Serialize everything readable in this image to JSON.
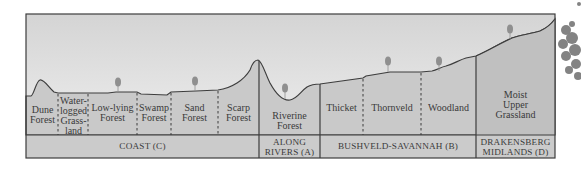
{
  "colors": {
    "sky_top": "#d6d6d6",
    "sky_bottom": "#ececec",
    "ground": "#c9c9c9",
    "band": "#cbcbcb",
    "line": "#3d3d3d",
    "tree": "#8f8f8f",
    "text": "#3a3a3a"
  },
  "vegetation_types": [
    {
      "label": "Dune\nForest",
      "x": 42,
      "y": 106
    },
    {
      "label": "Water-\nlogged\nGrass-\nland",
      "x": 73,
      "y": 96
    },
    {
      "label": "Low-lying\nForest",
      "x": 112,
      "y": 103
    },
    {
      "label": "Swamp\nForest",
      "x": 154,
      "y": 103
    },
    {
      "label": "Sand\nForest",
      "x": 194,
      "y": 103
    },
    {
      "label": "Scarp\nForest",
      "x": 238,
      "y": 103
    },
    {
      "label": "Riverine\nForest",
      "x": 290,
      "y": 111
    },
    {
      "label": "Thicket",
      "x": 341,
      "y": 103
    },
    {
      "label": "Thornveld",
      "x": 392,
      "y": 103
    },
    {
      "label": "Woodland",
      "x": 448,
      "y": 103
    },
    {
      "label": "Moist\nUpper\nGrassland",
      "x": 515,
      "y": 89
    }
  ],
  "regions": [
    {
      "label": "COAST (C)",
      "x": 142,
      "y": 140
    },
    {
      "label": "ALONG\nRIVERS (A)",
      "x": 289,
      "y": 140
    },
    {
      "label": "BUSHVELD-SAVANNAH (B)",
      "x": 398,
      "y": 140
    },
    {
      "label": "DRAKENSBERG\nMIDLANDS (D)",
      "x": 515,
      "y": 140
    }
  ]
}
